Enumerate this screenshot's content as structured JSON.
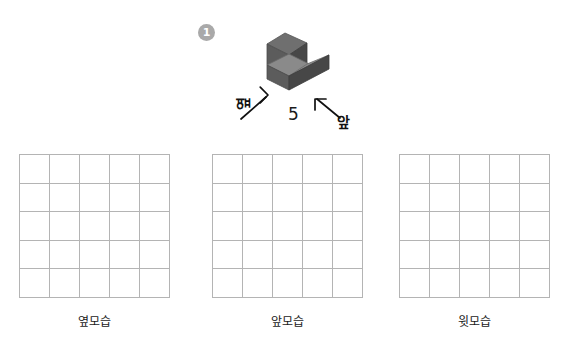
{
  "problem": {
    "number": "1"
  },
  "figure": {
    "solid_name": "L-shaped-stacked-cubes",
    "face_colors": {
      "top": "#6f6f6f",
      "left": "#5c5c5c",
      "right": "#474747"
    },
    "annotations": {
      "count_label": "5",
      "side_label": "옆",
      "front_label": "앞",
      "side_arrow_icon": "arrow-up-right-icon",
      "front_arrow_icon": "arrow-up-left-icon"
    }
  },
  "grids": [
    {
      "caption": "옆모습",
      "rows": 5,
      "cols": 5
    },
    {
      "caption": "앞모습",
      "rows": 5,
      "cols": 5
    },
    {
      "caption": "윗모습",
      "rows": 5,
      "cols": 5
    }
  ],
  "style": {
    "grid_line_color": "#b4b4b4",
    "badge_color": "#a9a9a9",
    "text_color": "#1a1a1a",
    "background": "#ffffff"
  }
}
